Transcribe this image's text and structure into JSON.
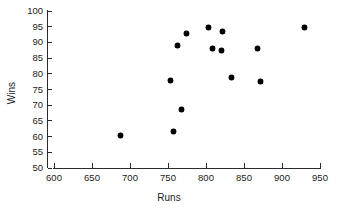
{
  "chart_data": {
    "type": "scatter",
    "title": "",
    "xlabel": "Runs",
    "ylabel": "Wins",
    "xlim": [
      600,
      950
    ],
    "ylim": [
      50,
      100
    ],
    "xticks": [
      600,
      650,
      700,
      750,
      800,
      850,
      900,
      950
    ],
    "yticks": [
      50,
      55,
      60,
      65,
      70,
      75,
      80,
      85,
      90,
      95,
      100
    ],
    "grid": false,
    "legend": null,
    "marker": "filled-diamond",
    "marker_color": "#000000",
    "points": [
      {
        "x": 688,
        "y": 60.5
      },
      {
        "x": 753,
        "y": 77.8
      },
      {
        "x": 757,
        "y": 61.5
      },
      {
        "x": 762,
        "y": 89.0
      },
      {
        "x": 768,
        "y": 68.5
      },
      {
        "x": 774,
        "y": 92.7
      },
      {
        "x": 803,
        "y": 94.6
      },
      {
        "x": 808,
        "y": 88.2
      },
      {
        "x": 821,
        "y": 87.3
      },
      {
        "x": 822,
        "y": 93.6
      },
      {
        "x": 834,
        "y": 78.7
      },
      {
        "x": 868,
        "y": 88.2
      },
      {
        "x": 872,
        "y": 77.7
      },
      {
        "x": 929,
        "y": 94.9
      }
    ]
  },
  "axes": {
    "x_title": "Runs",
    "y_title": "Wins",
    "x_tick_labels": [
      "600",
      "650",
      "700",
      "750",
      "800",
      "850",
      "900",
      "950"
    ],
    "y_tick_labels": [
      "50",
      "55",
      "60",
      "65",
      "70",
      "75",
      "80",
      "85",
      "90",
      "95",
      "100"
    ]
  }
}
